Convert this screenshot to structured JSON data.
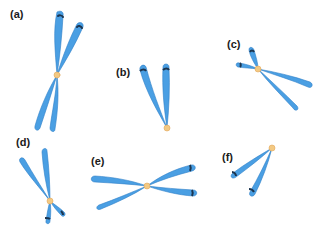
{
  "figure": {
    "colors": {
      "chromatid": "#4a9fe3",
      "chromatid_highlight": "#9fd2fa",
      "chromatid_edge": "#2f7fc8",
      "band": "#1c3550",
      "centromere": "#f3c983",
      "centromere_edge": "#e3a85a"
    },
    "panels": [
      {
        "id": "a",
        "label": "(a)"
      },
      {
        "id": "b",
        "label": "(b)"
      },
      {
        "id": "c",
        "label": "(c)"
      },
      {
        "id": "d",
        "label": "(d)"
      },
      {
        "id": "e",
        "label": "(e)"
      },
      {
        "id": "f",
        "label": "(f)"
      }
    ]
  }
}
